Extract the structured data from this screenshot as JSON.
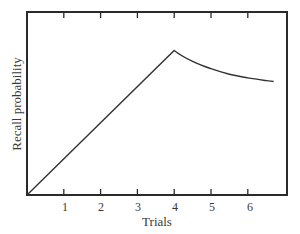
{
  "chart_data": {
    "type": "line",
    "title": "",
    "xlabel": "Trials",
    "ylabel": "Recall probability",
    "xlim": [
      0,
      7
    ],
    "ylim": [
      0,
      1
    ],
    "x_ticks": [
      1,
      2,
      3,
      4,
      5,
      6
    ],
    "y_ticks": [],
    "grid": false,
    "legend": null,
    "series": [
      {
        "name": "Recall probability",
        "x": [
          0,
          1,
          2,
          3,
          4,
          4.5,
          5,
          5.5,
          6,
          6.5,
          6.7
        ],
        "y": [
          0,
          0.2,
          0.4,
          0.59,
          0.79,
          0.73,
          0.69,
          0.66,
          0.64,
          0.625,
          0.62
        ]
      }
    ],
    "annotations": "Linear increase from trial 0 to peak at trial 4, then decelerating decay toward ~0.62 by trial ~6.7"
  },
  "axes": {
    "x_label": "Trials",
    "y_label": "Recall probability",
    "x_tick_labels": [
      "1",
      "2",
      "3",
      "4",
      "5",
      "6"
    ]
  },
  "colors": {
    "frame": "#2a2a2a",
    "line": "#333333",
    "text": "#3a3a3a",
    "background": "#ffffff"
  }
}
